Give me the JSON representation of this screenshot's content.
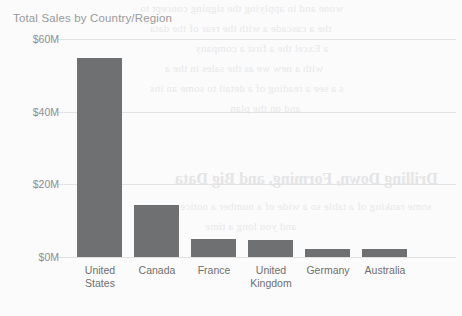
{
  "chart_data": {
    "type": "bar",
    "title": "Total Sales by Country/Region",
    "xlabel": "",
    "ylabel": "",
    "categories": [
      "United States",
      "Canada",
      "France",
      "United Kingdom",
      "Germany",
      "Australia"
    ],
    "category_lines": [
      [
        "United",
        "States"
      ],
      [
        "Canada"
      ],
      [
        "France"
      ],
      [
        "United",
        "Kingdom"
      ],
      [
        "Germany"
      ],
      [
        "Australia"
      ]
    ],
    "values": [
      54.8,
      14.2,
      5.0,
      4.8,
      2.2,
      2.1
    ],
    "value_unit": "M",
    "value_prefix": "$",
    "ylim": [
      0,
      60
    ],
    "yticks": [
      0,
      20,
      40,
      60
    ],
    "ytick_labels": [
      "$0M",
      "$20M",
      "$40M",
      "$60M"
    ],
    "grid": true,
    "legend": "none",
    "series": [
      {
        "name": "Total Sales",
        "values": [
          54.8,
          14.2,
          5.0,
          4.8,
          2.2,
          2.1
        ]
      }
    ]
  },
  "colors": {
    "bar": "#6f7072",
    "grid": "#e3e3e5",
    "title_text": "#9a9a9a",
    "axis_text": "#8e8e8e",
    "category_text": "#6f6f6f",
    "background": "#fbfbfb"
  },
  "bleed_through": {
    "lines": [
      "wone and in applying the signing concept to",
      "the a cascade a with the rear of the data",
      "a Excel the a first a company",
      "with a new we as the sales in the a",
      "s a see a reading of a detail to some an ins",
      "and on the plan"
    ],
    "heading": "Drilling Down, Forming, and Big Data",
    "tail_lines": [
      "some ranking of a table so a wide of a number a notice",
      "and you long a time"
    ]
  }
}
